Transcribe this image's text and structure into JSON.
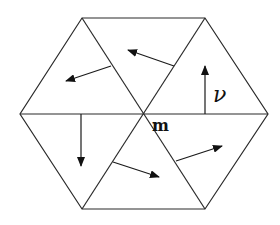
{
  "diagram": {
    "title": "",
    "labels": {
      "center_vertex": "m",
      "normal_vector": "ν"
    },
    "shape": "regular hexagon subdivided into 6 triangles meeting at vertex m",
    "triangle_count": 6,
    "arrows": [
      {
        "triangle": "upper-left",
        "direction": "left-down"
      },
      {
        "triangle": "top",
        "direction": "left-up"
      },
      {
        "triangle": "upper-right",
        "direction": "up",
        "label": "ν"
      },
      {
        "triangle": "lower-left",
        "direction": "down"
      },
      {
        "triangle": "bottom",
        "direction": "right-down"
      },
      {
        "triangle": "lower-right",
        "direction": "right-up"
      }
    ],
    "colors": {
      "stroke": "#2a2a2a",
      "background": "#ffffff"
    }
  }
}
